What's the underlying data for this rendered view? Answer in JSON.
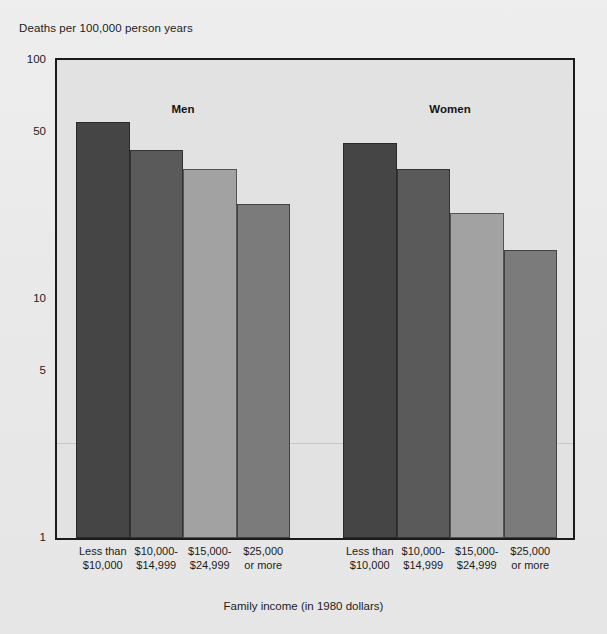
{
  "chart_data": {
    "type": "bar",
    "title": "",
    "ylabel": "Deaths per 100,000 person years",
    "xlabel": "Family income (in 1980 dollars)",
    "yscale": "log",
    "ylim": [
      1,
      100
    ],
    "ytick_labels": [
      "100",
      "50",
      "10",
      "5",
      "1"
    ],
    "ytick_values": [
      100,
      50,
      10,
      5,
      1
    ],
    "grid": false,
    "legend": "none",
    "categories": [
      "Less than $10,000",
      "$10,000-$14,999",
      "$15,000-$24,999",
      "$25,000 or more"
    ],
    "category_lines": [
      [
        "Less than",
        "$10,000"
      ],
      [
        "$10,000-",
        "$14,999"
      ],
      [
        "$15,000-",
        "$24,999"
      ],
      [
        "$25,000",
        "or more"
      ]
    ],
    "groups": [
      {
        "name": "Men",
        "values": [
          55,
          42,
          35,
          25
        ],
        "colors": [
          "#454545",
          "#5a5a5a",
          "#a2a2a2",
          "#7b7b7b"
        ]
      },
      {
        "name": "Women",
        "values": [
          45,
          35,
          23,
          16
        ],
        "colors": [
          "#454545",
          "#5a5a5a",
          "#a2a2a2",
          "#7b7b7b"
        ]
      }
    ]
  },
  "figure": {
    "background_color": "#ebebeb",
    "plot_background_color": "#e2e2e2",
    "axis_color": "#1b1b1b"
  }
}
